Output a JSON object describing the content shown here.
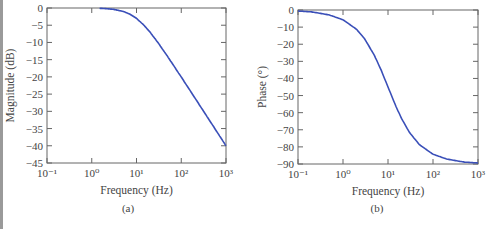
{
  "chart_data": [
    {
      "type": "line",
      "panel": "(a)",
      "title": "",
      "xlabel": "Frequency (Hz)",
      "ylabel": "Magnitude (dB)",
      "xscale": "log",
      "xlim": [
        0.1,
        1000
      ],
      "ylim": [
        -45,
        0
      ],
      "xticks": [
        "10⁻¹",
        "10⁰",
        "10¹",
        "10²",
        "10³"
      ],
      "yticks": [
        "0",
        "−5",
        "−10",
        "−15",
        "−20",
        "−25",
        "−30",
        "−35",
        "−40",
        "−45"
      ],
      "grid": false,
      "series": [
        {
          "name": "Magnitude",
          "color": "#3a4fb8",
          "x": [
            1.5,
            2,
            3,
            5,
            7,
            10,
            15,
            20,
            30,
            50,
            100,
            200,
            500,
            1000
          ],
          "y": [
            -0.1,
            -0.17,
            -0.37,
            -0.97,
            -1.74,
            -3.01,
            -5.12,
            -6.99,
            -10.0,
            -14.15,
            -20.04,
            -26.03,
            -33.98,
            -40.0
          ]
        }
      ]
    },
    {
      "type": "line",
      "panel": "(b)",
      "title": "",
      "xlabel": "Frequency (Hz)",
      "ylabel": "Phase (°)",
      "xscale": "log",
      "xlim": [
        0.1,
        1000
      ],
      "ylim": [
        -90,
        0
      ],
      "xticks": [
        "10⁻¹",
        "10⁰",
        "10¹",
        "10²",
        "10³"
      ],
      "yticks": [
        "0",
        "−10",
        "−20",
        "−30",
        "−40",
        "−50",
        "−60",
        "−70",
        "−80",
        "−90"
      ],
      "grid": false,
      "series": [
        {
          "name": "Phase",
          "color": "#3a4fb8",
          "x": [
            0.1,
            0.2,
            0.5,
            1,
            2,
            3,
            5,
            7,
            10,
            15,
            20,
            30,
            50,
            100,
            200,
            500,
            1000
          ],
          "y": [
            -0.6,
            -1.1,
            -2.9,
            -5.7,
            -11.3,
            -16.7,
            -26.6,
            -35.0,
            -45.0,
            -56.3,
            -63.4,
            -71.6,
            -78.7,
            -84.3,
            -87.1,
            -88.9,
            -89.4
          ]
        }
      ]
    }
  ],
  "captions": {
    "a": "(a)",
    "b": "(b)"
  },
  "colors": {
    "curve": "#3a4fb8",
    "axis": "#666666"
  }
}
